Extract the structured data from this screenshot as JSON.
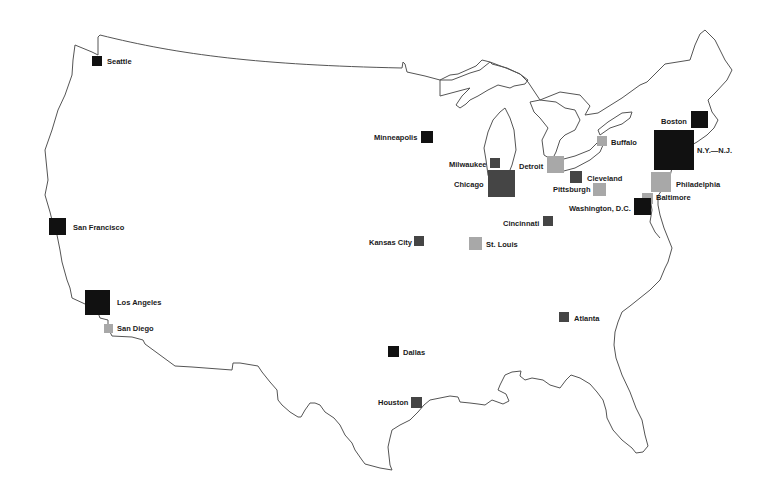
{
  "map": {
    "region": "United States",
    "shades": {
      "black": "#111111",
      "dark": "#454545",
      "light": "#a8a8a8"
    },
    "cities": [
      {
        "name": "Seattle",
        "x": 92,
        "y": 56,
        "size": 10,
        "shade": "black",
        "label_x": 107,
        "label_y": 57
      },
      {
        "name": "San Francisco",
        "x": 49,
        "y": 218,
        "size": 17,
        "shade": "black",
        "label_x": 73,
        "label_y": 223
      },
      {
        "name": "Los Angeles",
        "x": 85,
        "y": 290,
        "size": 25,
        "shade": "black",
        "label_x": 117,
        "label_y": 298
      },
      {
        "name": "San Diego",
        "x": 104,
        "y": 324,
        "size": 9,
        "shade": "light",
        "label_x": 117,
        "label_y": 324
      },
      {
        "name": "Minneapolis",
        "x": 421,
        "y": 131,
        "size": 12,
        "shade": "black",
        "label_x": 374,
        "label_y": 133
      },
      {
        "name": "Milwaukee",
        "x": 490,
        "y": 158,
        "size": 10,
        "shade": "dark",
        "label_x": 449,
        "label_y": 160
      },
      {
        "name": "Chicago",
        "x": 488,
        "y": 170,
        "size": 27,
        "shade": "dark",
        "label_x": 454,
        "label_y": 180
      },
      {
        "name": "Detroit",
        "x": 547,
        "y": 156,
        "size": 17,
        "shade": "light",
        "label_x": 519,
        "label_y": 162
      },
      {
        "name": "Buffalo",
        "x": 597,
        "y": 136,
        "size": 10,
        "shade": "light",
        "label_x": 611,
        "label_y": 138
      },
      {
        "name": "Cleveland",
        "x": 570,
        "y": 171,
        "size": 12,
        "shade": "dark",
        "label_x": 587,
        "label_y": 174
      },
      {
        "name": "Pittsburgh",
        "x": 593,
        "y": 183,
        "size": 13,
        "shade": "light",
        "label_x": 553,
        "label_y": 185
      },
      {
        "name": "Boston",
        "x": 691,
        "y": 111,
        "size": 17,
        "shade": "black",
        "label_x": 661,
        "label_y": 117
      },
      {
        "name": "N.Y.—N.J.",
        "x": 654,
        "y": 130,
        "size": 40,
        "shade": "black",
        "label_x": 697,
        "label_y": 146
      },
      {
        "name": "Philadelphia",
        "x": 651,
        "y": 172,
        "size": 20,
        "shade": "light",
        "label_x": 676,
        "label_y": 180
      },
      {
        "name": "Baltimore",
        "x": 642,
        "y": 193,
        "size": 11,
        "shade": "light",
        "label_x": 656,
        "label_y": 193
      },
      {
        "name": "Washington, D.C.",
        "x": 634,
        "y": 198,
        "size": 17,
        "shade": "black",
        "label_x": 569,
        "label_y": 204
      },
      {
        "name": "Cincinnati",
        "x": 543,
        "y": 216,
        "size": 10,
        "shade": "dark",
        "label_x": 503,
        "label_y": 219
      },
      {
        "name": "Kansas City",
        "x": 414,
        "y": 236,
        "size": 10,
        "shade": "dark",
        "label_x": 369,
        "label_y": 238
      },
      {
        "name": "St. Louis",
        "x": 469,
        "y": 237,
        "size": 13,
        "shade": "light",
        "label_x": 486,
        "label_y": 240
      },
      {
        "name": "Atlanta",
        "x": 559,
        "y": 312,
        "size": 10,
        "shade": "dark",
        "label_x": 574,
        "label_y": 314
      },
      {
        "name": "Dallas",
        "x": 388,
        "y": 346,
        "size": 11,
        "shade": "black",
        "label_x": 403,
        "label_y": 348
      },
      {
        "name": "Houston",
        "x": 411,
        "y": 397,
        "size": 11,
        "shade": "dark",
        "label_x": 378,
        "label_y": 398
      }
    ]
  }
}
